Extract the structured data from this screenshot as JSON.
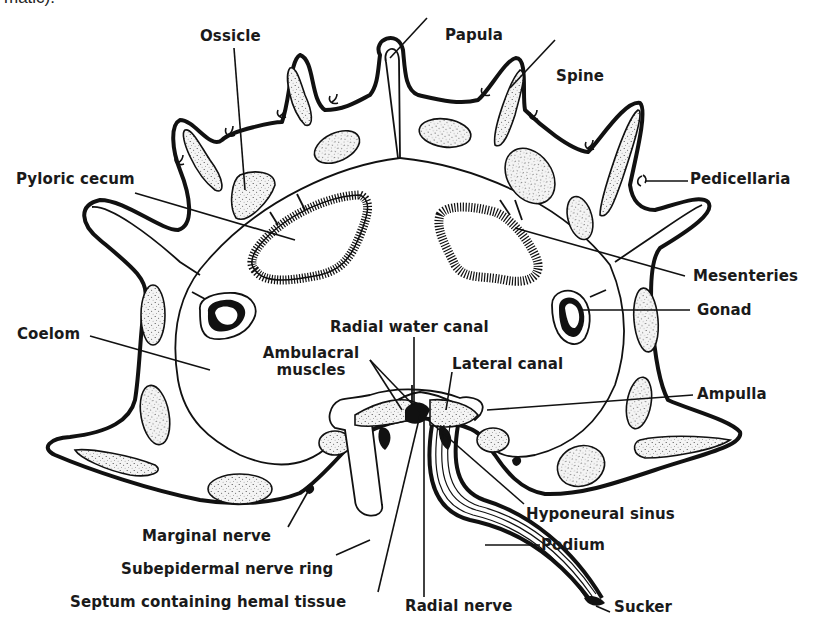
{
  "caption_fragment": "matic).",
  "figure": {
    "labels": {
      "ossicle": "Ossicle",
      "papula": "Papula",
      "spine": "Spine",
      "pedicellaria": "Pedicellaria",
      "pyloric_cecum": "Pyloric cecum",
      "mesenteries": "Mesenteries",
      "gonad": "Gonad",
      "coelom": "Coelom",
      "radial_water_canal": "Radial water canal",
      "ambulacral_muscles_line1": "Ambulacral",
      "ambulacral_muscles_line2": "muscles",
      "lateral_canal": "Lateral canal",
      "ampulla": "Ampulla",
      "hyponeural_sinus": "Hyponeural sinus",
      "marginal_nerve": "Marginal nerve",
      "podium": "Podium",
      "subepidermal_nerve_ring": "Subepidermal nerve ring",
      "septum_hemal_tissue": "Septum containing hemal tissue",
      "radial_nerve": "Radial nerve",
      "sucker": "Sucker"
    }
  },
  "colors": {
    "ink": "#111111",
    "background": "#ffffff"
  }
}
